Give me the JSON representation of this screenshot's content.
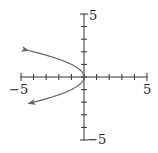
{
  "chart_data": {
    "type": "line",
    "title": "",
    "xlabel": "",
    "ylabel": "",
    "xlim": [
      -5,
      5
    ],
    "ylim": [
      -5,
      5
    ],
    "grid": false,
    "x_tick_labels": [
      "-5",
      "5"
    ],
    "y_tick_labels": [
      "5",
      "-5"
    ],
    "tick_step": 1,
    "series": [
      {
        "name": "x = -y^2",
        "equation": "x = -y^2",
        "points": [
          {
            "x": -4.41,
            "y": 2.1
          },
          {
            "x": -2.25,
            "y": 1.5
          },
          {
            "x": -1,
            "y": 1
          },
          {
            "x": -0.25,
            "y": 0.5
          },
          {
            "x": 0,
            "y": 0
          },
          {
            "x": -0.25,
            "y": -0.5
          },
          {
            "x": -1,
            "y": -1
          },
          {
            "x": -2.25,
            "y": -1.5
          },
          {
            "x": -4.41,
            "y": -2.1
          }
        ],
        "arrows_at_ends": true,
        "color": "#666666"
      }
    ],
    "labels": {
      "x_min": "−5",
      "x_max": "5",
      "y_max": "5",
      "y_min": "−5"
    }
  }
}
